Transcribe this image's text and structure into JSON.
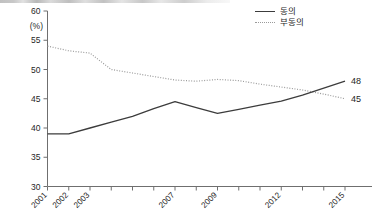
{
  "legend": {
    "items": [
      {
        "label": "동의",
        "style": "solid",
        "color": "#3c3c3c"
      },
      {
        "label": "부동의",
        "style": "dotted",
        "color": "#9a9a9a"
      }
    ]
  },
  "axis": {
    "y_unit": "(%)",
    "y_ticks": [
      "60",
      "55",
      "50",
      "45",
      "40",
      "35",
      "30"
    ],
    "x_labels": [
      "2001",
      "2002",
      "2003",
      "2007",
      "2009",
      "2012",
      "2015"
    ]
  },
  "end_labels": {
    "agree": "48",
    "disagree": "45"
  },
  "chart_data": {
    "type": "line",
    "title": "",
    "xlabel": "",
    "ylabel": "(%)",
    "ylim": [
      30,
      60
    ],
    "ytick_step": 5,
    "grid": false,
    "legend_position": "top-right",
    "x": [
      2001,
      2002,
      2003,
      2004,
      2005,
      2006,
      2007,
      2008,
      2009,
      2010,
      2011,
      2012,
      2013,
      2014,
      2015
    ],
    "xtick_labels_shown": [
      "2001",
      "2002",
      "2003",
      "",
      "",
      "",
      "2007",
      "",
      "2009",
      "",
      "",
      "2012",
      "",
      "",
      "2015"
    ],
    "series": [
      {
        "name": "동의",
        "style": "solid",
        "color": "#3c3c3c",
        "values": [
          39.0,
          39.0,
          40.0,
          41.0,
          42.0,
          43.3,
          44.5,
          43.5,
          42.5,
          43.2,
          43.9,
          44.6,
          45.6,
          46.8,
          48.0
        ],
        "end_label": "48"
      },
      {
        "name": "부동의",
        "style": "dotted",
        "color": "#9a9a9a",
        "values": [
          54.0,
          53.2,
          52.8,
          50.0,
          49.4,
          48.8,
          48.2,
          48.0,
          48.3,
          48.1,
          47.5,
          47.0,
          46.5,
          45.8,
          45.0
        ],
        "end_label": "45"
      }
    ],
    "annotations": [
      {
        "text": "48",
        "series": "동의",
        "x": 2015
      },
      {
        "text": "45",
        "series": "부동의",
        "x": 2015
      }
    ]
  }
}
